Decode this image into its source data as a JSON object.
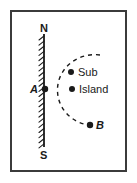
{
  "figure": {
    "background_color": "#ffffff",
    "frame_color": "#3b3b3b",
    "ink_color": "#1a1a1a"
  },
  "coastline": {
    "name": "coastline-wall",
    "description": "vertical hatched line representing a straight shoreline running north-south",
    "x": 44,
    "y_top": 34,
    "y_bottom": 147,
    "hatch_side": "left",
    "hatch_count": 22
  },
  "compass_labels": {
    "north": "N",
    "south": "S"
  },
  "points": [
    {
      "id": "A",
      "label": "A",
      "label_style": "italic",
      "x": 45,
      "y": 89,
      "dot_radius": 3.2
    },
    {
      "id": "B",
      "label": "B",
      "label_style": "italic",
      "x": 90,
      "y": 125,
      "dot_radius": 3.2
    },
    {
      "id": "sub",
      "label": "Sub",
      "label_style": "normal",
      "x": 71,
      "y": 72,
      "dot_radius": 3.0
    },
    {
      "id": "island",
      "label": "Island",
      "label_style": "normal",
      "x": 72,
      "y": 89,
      "dot_radius": 3.0
    }
  ],
  "arc": {
    "name": "dashed-arc",
    "description": "dashed arc bulging west, passing from upper right through Sub down to B",
    "path": "M 100 55 C 78 52, 58 68, 57.5 89 C 57 110, 74 124, 90 125",
    "dash": "4 4",
    "stroke_width": 1.4
  }
}
